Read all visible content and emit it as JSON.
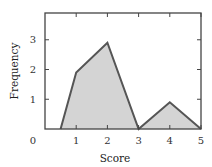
{
  "chart_data": {
    "type": "area",
    "title": "",
    "xlabel": "Score",
    "ylabel": "Frequency",
    "x": [
      0.5,
      1,
      2,
      3,
      4,
      5
    ],
    "series": [
      {
        "name": "Frequency",
        "values": [
          0,
          1.9,
          2.9,
          0,
          0.9,
          0
        ]
      }
    ],
    "xlim": [
      0,
      5
    ],
    "ylim": [
      0,
      3.9
    ],
    "xticks": [
      1,
      2,
      3,
      4,
      5
    ],
    "yticks": [
      1,
      2,
      3
    ],
    "origin_label": "0",
    "grid": false,
    "legend": null,
    "colors": {
      "fill": "#d4d4d4",
      "line": "#555555",
      "frame": "#444444"
    }
  }
}
